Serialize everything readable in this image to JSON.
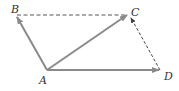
{
  "diagram": {
    "type": "vector-parallelogram",
    "points": {
      "A": {
        "label": "A",
        "x": 47,
        "y": 70
      },
      "B": {
        "label": "B",
        "x": 16,
        "y": 16
      },
      "C": {
        "label": "C",
        "x": 128,
        "y": 14
      },
      "D": {
        "label": "D",
        "x": 160,
        "y": 70
      }
    },
    "vectors": [
      {
        "from": "A",
        "to": "B",
        "style": "solid",
        "arrow": true
      },
      {
        "from": "A",
        "to": "C",
        "style": "solid",
        "arrow": true
      },
      {
        "from": "A",
        "to": "D",
        "style": "solid",
        "arrow": true
      },
      {
        "from": "B",
        "to": "C",
        "style": "dashed",
        "arrow": false
      },
      {
        "from": "D",
        "to": "C",
        "style": "dashed",
        "arrow": true
      }
    ],
    "colors": {
      "vector": "#8a8a8a",
      "dashed": "#555555",
      "label": "#333333"
    }
  }
}
